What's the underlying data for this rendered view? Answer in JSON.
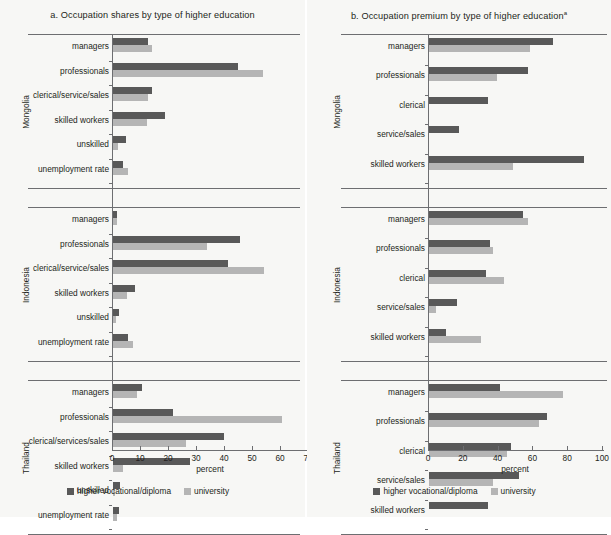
{
  "figure": {
    "background": "#f7f7f5",
    "dark_color": "#595959",
    "light_color": "#b5b5b5",
    "axis_color": "#6d6e71"
  },
  "legend": {
    "items": [
      {
        "label": "higher vocational/diploma",
        "color": "#595959",
        "swatch": "dark"
      },
      {
        "label": "university",
        "color": "#b5b5b5",
        "swatch": "light"
      }
    ]
  },
  "panels": {
    "left": {
      "title": "a. Occupation shares by type of higher education",
      "xlabel": "percent",
      "countries": [
        "Mongolia",
        "Indonesia",
        "Thailand"
      ]
    },
    "right": {
      "title": "b. Occupation premium by type of higher education",
      "title_superscript": "a",
      "xlabel": "percent",
      "countries": [
        "Mongolia",
        "Indonesia",
        "Thailand"
      ]
    }
  },
  "chart_data": [
    {
      "id": "panel-a",
      "type": "bar",
      "orientation": "horizontal",
      "title": "a. Occupation shares by type of higher education",
      "xlabel": "percent",
      "ylabel": "",
      "xlim": [
        0,
        70
      ],
      "xticks": [
        0,
        10,
        20,
        30,
        40,
        50,
        60,
        70
      ],
      "grid": false,
      "legend_position": "bottom",
      "series": [
        {
          "name": "higher vocational/diploma",
          "color": "#595959"
        },
        {
          "name": "university",
          "color": "#b5b5b5"
        }
      ],
      "groups": [
        {
          "country": "Mongolia",
          "categories": [
            "managers",
            "professionals",
            "clerical/service/sales",
            "skilled workers",
            "unskilled",
            "unemployment rate"
          ],
          "values": {
            "higher vocational/diploma": [
              12.5,
              44.5,
              14.0,
              18.5,
              4.5,
              3.5
            ],
            "university": [
              14.0,
              53.5,
              12.5,
              12.0,
              1.8,
              5.5
            ]
          }
        },
        {
          "country": "Indonesia",
          "categories": [
            "managers",
            "professionals",
            "clerical/service/sales",
            "skilled workers",
            "unskilled",
            "unemployment rate"
          ],
          "values": {
            "higher vocational/diploma": [
              1.5,
              45.5,
              41.0,
              8.0,
              2.0,
              5.5
            ],
            "university": [
              1.5,
              33.5,
              54.0,
              5.0,
              1.2,
              7.0
            ]
          }
        },
        {
          "country": "Thailand",
          "categories": [
            "managers",
            "professionals",
            "clerical/services/sales",
            "skilled workers",
            "unskilled",
            "unemployment rate"
          ],
          "values": {
            "higher vocational/diploma": [
              10.5,
              21.5,
              39.5,
              27.5,
              2.5,
              2.0
            ],
            "university": [
              8.5,
              60.5,
              26.0,
              3.5,
              0.8,
              1.5
            ]
          }
        }
      ]
    },
    {
      "id": "panel-b",
      "type": "bar",
      "orientation": "horizontal",
      "title": "b. Occupation premium by type of higher education",
      "xlabel": "percent",
      "ylabel": "",
      "xlim": [
        0,
        100
      ],
      "xticks": [
        0,
        20,
        40,
        60,
        80,
        100
      ],
      "grid": false,
      "legend_position": "bottom",
      "series": [
        {
          "name": "higher vocational/diploma",
          "color": "#595959"
        },
        {
          "name": "university",
          "color": "#b5b5b5"
        }
      ],
      "groups": [
        {
          "country": "Mongolia",
          "categories": [
            "managers",
            "professionals",
            "clerical",
            "service/sales",
            "skilled workers"
          ],
          "values": {
            "higher vocational/diploma": [
              71.0,
              57.0,
              34.0,
              17.0,
              89.0
            ],
            "university": [
              58.0,
              39.0,
              0.0,
              0.0,
              48.0
            ]
          }
        },
        {
          "country": "Indonesia",
          "categories": [
            "managers",
            "professionals",
            "clerical",
            "service/sales",
            "skilled workers"
          ],
          "values": {
            "higher vocational/diploma": [
              54.0,
              35.0,
              33.0,
              16.0,
              10.0
            ],
            "university": [
              57.0,
              37.0,
              43.0,
              4.0,
              30.0
            ]
          }
        },
        {
          "country": "Thailand",
          "categories": [
            "managers",
            "professionals",
            "clerical",
            "service/sales",
            "skilled workers"
          ],
          "values": {
            "higher vocational/diploma": [
              41.0,
              68.0,
              47.0,
              52.0,
              34.0
            ],
            "university": [
              77.0,
              63.0,
              45.0,
              37.0,
              0.0
            ]
          }
        }
      ]
    }
  ]
}
